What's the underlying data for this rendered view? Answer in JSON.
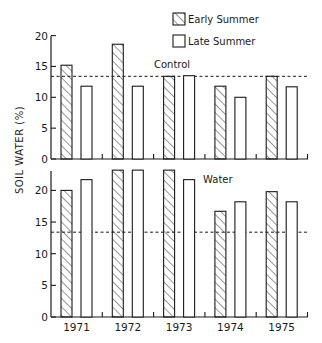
{
  "chart_data": {
    "type": "bar",
    "title": "",
    "xlabel": "",
    "ylabel": "SOIL WATER (%)",
    "categories": [
      "1971",
      "1972",
      "1973",
      "1974",
      "1975"
    ],
    "legend": {
      "position": "top-right",
      "entries": [
        {
          "name": "Early Summer",
          "pattern": "diagonal-hatch"
        },
        {
          "name": "Late Summer",
          "pattern": "open"
        }
      ]
    },
    "panels": [
      {
        "label": "Control",
        "ylim": [
          0,
          20
        ],
        "yticks": [
          0,
          5,
          10,
          15,
          20
        ],
        "reference_line": 13.4,
        "series": [
          {
            "name": "Early Summer",
            "values": [
              15.2,
              18.6,
              13.4,
              11.8,
              13.4
            ]
          },
          {
            "name": "Late Summer",
            "values": [
              11.8,
              11.8,
              13.5,
              10.0,
              11.7
            ]
          }
        ]
      },
      {
        "label": "Water",
        "ylim": [
          0,
          23.5
        ],
        "yticks": [
          0,
          5,
          10,
          15,
          20
        ],
        "reference_line": 13.4,
        "series": [
          {
            "name": "Early Summer",
            "values": [
              20.0,
              23.2,
              23.2,
              16.7,
              19.8
            ]
          },
          {
            "name": "Late Summer",
            "values": [
              21.7,
              23.2,
              21.7,
              18.2,
              18.2
            ]
          }
        ]
      }
    ],
    "grid": false
  },
  "colors": {
    "ink": "#1a1a1a",
    "background": "#ffffff"
  }
}
